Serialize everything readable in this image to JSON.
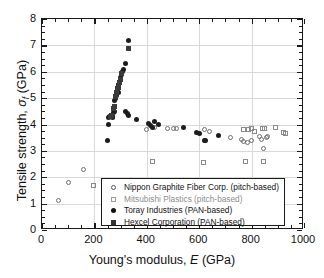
{
  "chart_data": {
    "type": "scatter",
    "title": "",
    "xlabel": "Young's modulus, E (GPa)",
    "ylabel": "Tensile strength, σf (GPa)",
    "xlim": [
      0,
      1000
    ],
    "ylim": [
      0,
      8
    ],
    "xticks": [
      0,
      200,
      400,
      600,
      800,
      1000
    ],
    "yticks": [
      0,
      1,
      2,
      3,
      4,
      5,
      6,
      7,
      8
    ],
    "xtick_labels": [
      "0",
      "200",
      "400",
      "600",
      "800",
      "1000"
    ],
    "ytick_labels": [
      "0",
      "1",
      "2",
      "3",
      "4",
      "5",
      "6",
      "7",
      "8"
    ],
    "x_minor_step": 50,
    "y_minor_step": 0.25,
    "grid": true,
    "grid_color": "#d8d8d8",
    "legend_position": "lower-center",
    "series": [
      {
        "name": "Nippon Graphite Fiber Corp. (pitch-based)",
        "marker": "open-circle",
        "color": "#6e6e6e",
        "points": [
          [
            62,
            1.1
          ],
          [
            103,
            1.8
          ],
          [
            160,
            2.3
          ],
          [
            400,
            3.8
          ],
          [
            480,
            3.85
          ],
          [
            500,
            3.85
          ],
          [
            512,
            3.85
          ],
          [
            430,
            3.9
          ],
          [
            620,
            3.8
          ],
          [
            640,
            3.75
          ],
          [
            720,
            3.5
          ],
          [
            760,
            3.45
          ],
          [
            770,
            3.35
          ],
          [
            785,
            3.3
          ],
          [
            800,
            3.4
          ],
          [
            830,
            3.55
          ],
          [
            838,
            3.45
          ],
          [
            845,
            3.1
          ],
          [
            855,
            3.5
          ],
          [
            860,
            3.55
          ]
        ]
      },
      {
        "name": "Mitsubishi Plastics (pitch-based)",
        "marker": "open-square",
        "color": "#8a8a8a",
        "points": [
          [
            195,
            1.7
          ],
          [
            420,
            2.6
          ],
          [
            615,
            2.55
          ],
          [
            770,
            3.8
          ],
          [
            790,
            3.8
          ],
          [
            800,
            3.85
          ],
          [
            812,
            3.75
          ],
          [
            840,
            3.85
          ],
          [
            848,
            3.85
          ],
          [
            890,
            3.9
          ],
          [
            922,
            3.7
          ],
          [
            928,
            3.65
          ],
          [
            778,
            2.6
          ],
          [
            845,
            2.6
          ]
        ]
      },
      {
        "name": "Toray Industries (PAN-based)",
        "marker": "filled-circle",
        "color": "#1c1c1c",
        "points": [
          [
            250,
            3.4
          ],
          [
            252,
            4.0
          ],
          [
            255,
            4.25
          ],
          [
            258,
            4.3
          ],
          [
            262,
            4.3
          ],
          [
            265,
            4.35
          ],
          [
            268,
            4.25
          ],
          [
            270,
            4.3
          ],
          [
            272,
            4.45
          ],
          [
            275,
            4.5
          ],
          [
            278,
            4.9
          ],
          [
            282,
            5.0
          ],
          [
            285,
            5.1
          ],
          [
            288,
            5.3
          ],
          [
            292,
            5.5
          ],
          [
            295,
            5.6
          ],
          [
            298,
            5.8
          ],
          [
            302,
            5.9
          ],
          [
            308,
            6.0
          ],
          [
            312,
            6.1
          ],
          [
            320,
            6.3
          ],
          [
            330,
            7.2
          ],
          [
            318,
            4.5
          ],
          [
            325,
            4.4
          ],
          [
            332,
            4.35
          ],
          [
            360,
            4.2
          ],
          [
            405,
            4.05
          ],
          [
            415,
            3.95
          ],
          [
            420,
            3.9
          ],
          [
            428,
            4.1
          ],
          [
            445,
            4.0
          ],
          [
            540,
            3.9
          ],
          [
            590,
            3.7
          ],
          [
            600,
            3.65
          ],
          [
            620,
            3.4
          ],
          [
            625,
            3.4
          ],
          [
            672,
            3.6
          ],
          [
            292,
            5.2
          ]
        ]
      },
      {
        "name": "Hexcel Corporation (PAN-based)",
        "marker": "filled-square",
        "color": "#3a3a3a",
        "points": [
          [
            330,
            6.9
          ],
          [
            305,
            5.95
          ],
          [
            300,
            5.7
          ],
          [
            296,
            5.6
          ],
          [
            292,
            5.4
          ],
          [
            288,
            5.35
          ],
          [
            284,
            5.2
          ],
          [
            280,
            5.05
          ],
          [
            276,
            4.7
          ],
          [
            272,
            4.6
          ],
          [
            266,
            4.35
          ],
          [
            260,
            4.3
          ]
        ]
      }
    ]
  },
  "axes": {
    "x_title_prefix": "Young's modulus, ",
    "x_title_var": "E",
    "x_title_suffix": " (GPa)",
    "y_title_prefix": "Tensile strength, ",
    "y_title_var": "σ",
    "y_title_sub": "f",
    "y_title_suffix": " (GPa)"
  },
  "legend": {
    "items": [
      {
        "marker": "open-circle",
        "label": "Nippon Graphite Fiber Corp. (pitch-based)"
      },
      {
        "marker": "open-square",
        "label": "Mitsubishi Plastics (pitch-based)"
      },
      {
        "marker": "filled-circle",
        "label": "Toray Industries (PAN-based)"
      },
      {
        "marker": "filled-square",
        "label": "Hexcel Corporation (PAN-based)"
      }
    ]
  }
}
